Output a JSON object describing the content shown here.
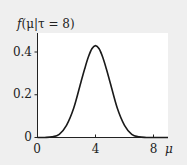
{
  "chart_data": {
    "type": "line",
    "title": "f(μ|τ = 8)",
    "xlabel": "μ",
    "ylabel": "f(μ|τ = 8)",
    "x_ticks": [
      0,
      4,
      8
    ],
    "y_ticks": [
      0,
      0.2,
      0.4
    ],
    "x_tick_labels": [
      "0",
      "4",
      "8"
    ],
    "y_tick_labels": [
      "0",
      "0.2",
      "0.4"
    ],
    "xlim": [
      0,
      9
    ],
    "ylim": [
      0,
      0.48
    ],
    "grid": false,
    "legend": null,
    "series": [
      {
        "name": "f(μ|τ = 8)",
        "x": [
          0,
          0.5,
          1,
          1.5,
          2,
          2.5,
          3,
          3.25,
          3.5,
          3.75,
          4,
          4.25,
          4.5,
          4.75,
          5,
          5.5,
          6,
          6.5,
          7,
          7.5,
          8,
          8.5,
          9
        ],
        "values": [
          0.0,
          0.0003,
          0.003,
          0.015,
          0.057,
          0.138,
          0.26,
          0.32,
          0.375,
          0.415,
          0.43,
          0.415,
          0.375,
          0.32,
          0.26,
          0.138,
          0.057,
          0.015,
          0.003,
          0.0003,
          0.0,
          0.0,
          0.0
        ]
      }
    ]
  },
  "labels": {
    "ylabel_f": "f",
    "ylabel_rest": "(μ|τ = 8)",
    "xlabel": "μ",
    "xticks": [
      "0",
      "4",
      "8"
    ],
    "yticks": [
      "0",
      "0.2",
      "0.4"
    ]
  },
  "colors": {
    "background": "#efefef",
    "plot_area": "#ffffff",
    "line": "#1a1a1a"
  }
}
